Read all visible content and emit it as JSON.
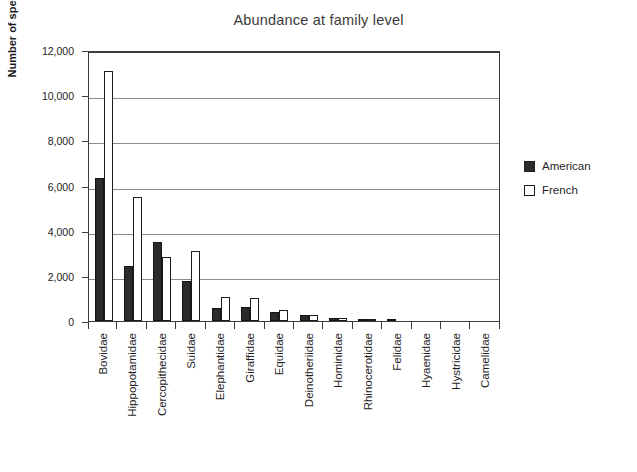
{
  "chart_data": {
    "type": "bar",
    "title": "Abundance at family level",
    "xlabel": "",
    "ylabel": "Number of specimens",
    "ylim": [
      0,
      12000
    ],
    "ytick_values": [
      0,
      2000,
      4000,
      6000,
      8000,
      10000,
      12000
    ],
    "ytick_labels": [
      "0",
      "2,000",
      "4,000",
      "6,000",
      "8,000",
      "10,000",
      "12,000"
    ],
    "grid": "horizontal",
    "legend_position": "right",
    "categories": [
      "Bovidae",
      "Hippopotamidae",
      "Cercopithecidae",
      "Suidae",
      "Elephantidae",
      "Giraffidae",
      "Equidae",
      "Deinotheriidae",
      "Hominidae",
      "Rhinocerotidae",
      "Felidae",
      "Hyaenidae",
      "Hystricidae",
      "Camelidae"
    ],
    "series": [
      {
        "name": "American",
        "color": "#2b2b2b",
        "values": [
          6350,
          2450,
          3500,
          1780,
          580,
          600,
          400,
          280,
          150,
          60,
          90,
          20,
          10,
          5
        ]
      },
      {
        "name": "French",
        "color": "#ffffff",
        "values": [
          11050,
          5500,
          2850,
          3100,
          1050,
          1030,
          480,
          250,
          120,
          110,
          30,
          10,
          5,
          0
        ]
      }
    ]
  },
  "legend": {
    "items": [
      {
        "label": "American",
        "swatch": "filled-square"
      },
      {
        "label": "French",
        "swatch": "outlined-square"
      }
    ]
  }
}
